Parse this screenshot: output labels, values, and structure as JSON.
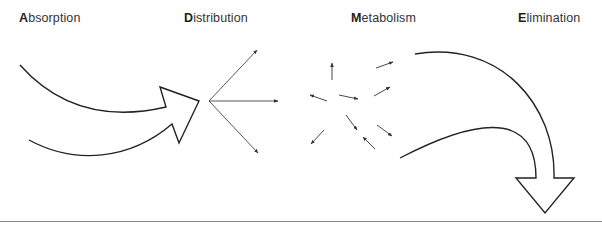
{
  "diagram": {
    "type": "pharmacokinetics-ADME",
    "stages": [
      {
        "initial": "A",
        "rest": "bsorption",
        "label": "Absorption"
      },
      {
        "initial": "D",
        "rest": "istribution",
        "label": "Distribution"
      },
      {
        "initial": "M",
        "rest": "etabolism",
        "label": "Metabolism"
      },
      {
        "initial": "E",
        "rest": "limination",
        "label": "Elimination"
      }
    ],
    "colors": {
      "stroke": "#222222",
      "thin_stroke": "#444444",
      "baseline": "#888888",
      "text": "#333333"
    }
  }
}
